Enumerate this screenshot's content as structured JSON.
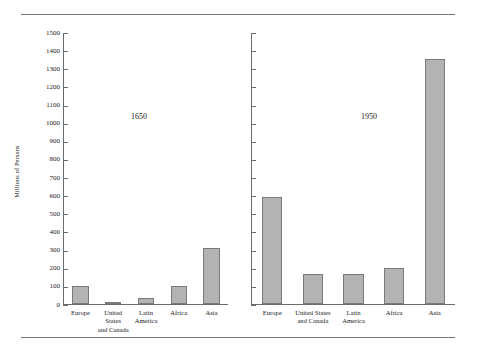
{
  "chart_data": {
    "type": "bar",
    "title": "",
    "xlabel": "",
    "ylabel": "Millions of Persons",
    "ylim": [
      0,
      1500
    ],
    "ytick_step": 100,
    "yticks": [
      0,
      100,
      200,
      300,
      400,
      500,
      600,
      700,
      800,
      900,
      1000,
      1100,
      1200,
      1300,
      1400,
      1500
    ],
    "grid": false,
    "legend": "none",
    "categories": [
      "Europe",
      "United States and Canada",
      "Latin America",
      "Africa",
      "Asia"
    ],
    "category_label_lines": [
      [
        "Europe"
      ],
      [
        "United States",
        "and Canada"
      ],
      [
        "Latin",
        "America"
      ],
      [
        "Africa"
      ],
      [
        "Asia"
      ]
    ],
    "panels": [
      {
        "name": "1650",
        "annotation": "1650",
        "values": [
          100,
          12,
          35,
          100,
          310
        ]
      },
      {
        "name": "1950",
        "annotation": "1950",
        "values": [
          590,
          166,
          163,
          198,
          1350
        ]
      }
    ],
    "series": [
      {
        "name": "1650",
        "values": [
          100,
          12,
          35,
          100,
          310
        ]
      },
      {
        "name": "1950",
        "values": [
          590,
          166,
          163,
          198,
          1350
        ]
      }
    ],
    "colors": {
      "bar_fill": "#b3b3b3",
      "bar_stroke": "#7a7a7a",
      "axis": "#6b6b6b",
      "rule": "#777777",
      "text": "#1a1a1a",
      "background": "#ffffff"
    }
  }
}
